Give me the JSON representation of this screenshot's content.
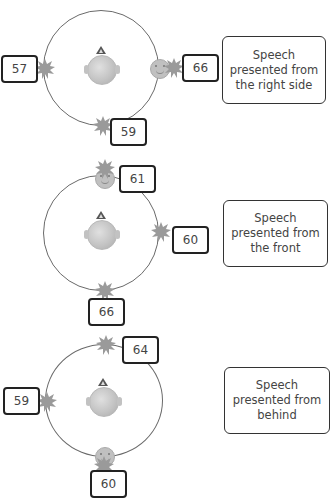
{
  "icons": {
    "listener_head": "head-top-view-icon",
    "speaker": "noise-burst-icon",
    "talker": "face-icon"
  },
  "colors": {
    "ring": "#6a6a6a",
    "box_border": "#222222",
    "icon_gray": "#9a9a9a",
    "text": "#444444"
  },
  "panels": [
    {
      "caption": "Speech\npresented from\nthe right side",
      "speech_position": "right",
      "scores": {
        "left": "57",
        "right": "66",
        "bottom": "59"
      }
    },
    {
      "caption": "Speech\npresented from\nthe front",
      "speech_position": "front",
      "scores": {
        "top": "61",
        "right": "60",
        "bottom": "66"
      }
    },
    {
      "caption": "Speech\npresented from\nbehind",
      "speech_position": "behind",
      "scores": {
        "top": "64",
        "left": "59",
        "bottom": "60"
      }
    }
  ]
}
